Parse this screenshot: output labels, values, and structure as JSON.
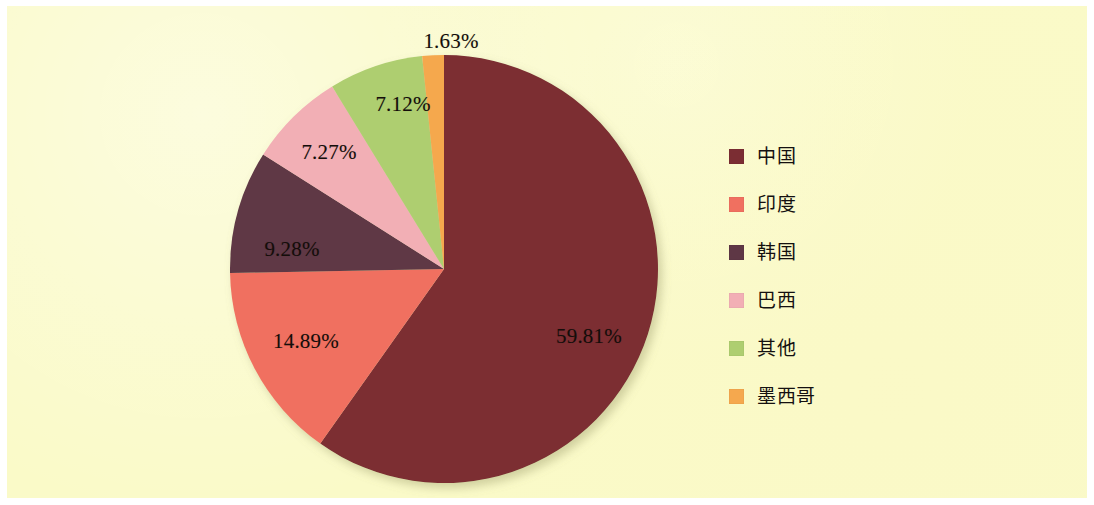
{
  "figure": {
    "background_color": "#fafac8",
    "outer_margin_color": "#ffffff"
  },
  "chart_data": {
    "type": "pie",
    "title": "",
    "subtitle": "",
    "xlabel": "",
    "ylabel": "",
    "grid": false,
    "legend_position": "right",
    "value_suffix": "%",
    "start_angle_deg": 0,
    "direction": "clockwise",
    "center": {
      "x": 437,
      "y": 263
    },
    "radius": 214,
    "categories": [
      "中国",
      "印度",
      "韩国",
      "巴西",
      "其他",
      "墨西哥"
    ],
    "values": [
      59.81,
      14.89,
      9.28,
      7.27,
      7.12,
      1.63
    ],
    "value_labels": [
      "59.81%",
      "14.89%",
      "9.28%",
      "7.27%",
      "7.12%",
      "1.63%"
    ],
    "colors": [
      "#7b2d33",
      "#f07060",
      "#5e3745",
      "#f2afb5",
      "#aece70",
      "#f5a84e"
    ],
    "slices": [
      {
        "name": "中国",
        "value": 59.81,
        "label": "59.81%",
        "color": "#7b2d33",
        "start_deg": 0,
        "end_deg": 215.316,
        "label_pos": {
          "x": 582,
          "y": 330
        }
      },
      {
        "name": "印度",
        "value": 14.89,
        "label": "14.89%",
        "color": "#f07060",
        "start_deg": 215.316,
        "end_deg": 268.92,
        "label_pos": {
          "x": 299,
          "y": 335
        }
      },
      {
        "name": "韩国",
        "value": 9.28,
        "label": "9.28%",
        "color": "#5e3745",
        "start_deg": 268.92,
        "end_deg": 302.328,
        "label_pos": {
          "x": 285,
          "y": 243
        }
      },
      {
        "name": "巴西",
        "value": 7.27,
        "label": "7.27%",
        "color": "#f2afb5",
        "start_deg": 302.328,
        "end_deg": 328.5,
        "label_pos": {
          "x": 322,
          "y": 146
        }
      },
      {
        "name": "其他",
        "value": 7.12,
        "label": "7.12%",
        "color": "#aece70",
        "start_deg": 328.5,
        "end_deg": 354.132,
        "label_pos": {
          "x": 396,
          "y": 98
        }
      },
      {
        "name": "墨西哥",
        "value": 1.63,
        "label": "1.63%",
        "color": "#f5a84e",
        "start_deg": 354.132,
        "end_deg": 360,
        "label_pos": {
          "x": 444,
          "y": 35
        }
      }
    ]
  },
  "legend": {
    "items": [
      {
        "label": "中国",
        "color": "#7b2d33"
      },
      {
        "label": "印度",
        "color": "#f07060"
      },
      {
        "label": "韩国",
        "color": "#5e3745"
      },
      {
        "label": "巴西",
        "color": "#f2afb5"
      },
      {
        "label": "其他",
        "color": "#aece70"
      },
      {
        "label": "墨西哥",
        "color": "#f5a84e"
      }
    ]
  }
}
